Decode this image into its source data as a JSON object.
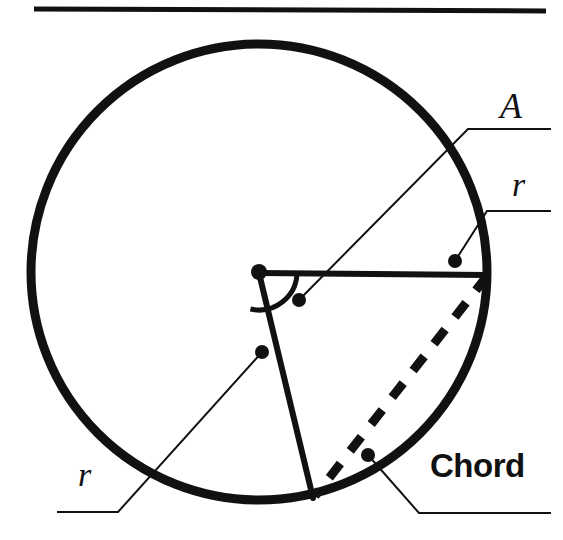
{
  "figure": {
    "background_color": "#ffffff",
    "ink_color": "#111111",
    "width": 563,
    "height": 540
  },
  "top_rule": {
    "name": "horizontal-rule",
    "x1": 34,
    "y1": 9,
    "x2": 546,
    "y2": 11,
    "thickness": 5
  },
  "circle": {
    "center_x": 259,
    "center_y": 272,
    "radius": 228,
    "stroke_width": 9,
    "color": "#111111"
  },
  "center_point": {
    "x": 259,
    "y": 272,
    "dot_radius": 8
  },
  "radii": [
    {
      "name": "radius-horizontal",
      "x1": 259,
      "y1": 273,
      "x2": 487,
      "y2": 275,
      "stroke_width": 6,
      "label": "r"
    },
    {
      "name": "radius-lower",
      "x1": 259,
      "y1": 273,
      "x2": 313,
      "y2": 498,
      "stroke_width": 6,
      "label": "r"
    }
  ],
  "chord": {
    "name": "chord-dashed",
    "x1": 487,
    "y1": 276,
    "x2": 315,
    "y2": 496,
    "stroke_width": 9,
    "dash": "18 16",
    "label": "Chord"
  },
  "angle_arc": {
    "name": "central-angle-arc",
    "center_x": 259,
    "center_y": 272,
    "radius": 38,
    "start_angle_deg": 0,
    "end_angle_deg": 103,
    "stroke_width": 5,
    "label": "A"
  },
  "labels": {
    "angle": {
      "text": "A",
      "style": "italic-serif",
      "leader": {
        "dot_x": 299,
        "dot_y": 300,
        "kink_x": 468,
        "kink_y": 129,
        "end_x": 551,
        "end_y": 129
      }
    },
    "radius_right": {
      "text": "r",
      "style": "italic-serif",
      "leader": {
        "dot_x": 455,
        "dot_y": 261,
        "kink_x": 487,
        "kink_y": 211,
        "end_x": 551,
        "end_y": 211
      }
    },
    "radius_left": {
      "text": "r",
      "style": "italic-serif",
      "leader": {
        "dot_x": 262,
        "dot_y": 352,
        "kink_x": 118,
        "kink_y": 512,
        "end_x": 57,
        "end_y": 512
      }
    },
    "chord": {
      "text": "Chord",
      "style": "bold-sans",
      "leader": {
        "dot_x": 368,
        "dot_y": 455,
        "kink_x": 419,
        "kink_y": 513,
        "end_x": 551,
        "end_y": 513
      }
    }
  },
  "leader_style": {
    "stroke_width": 2,
    "dot_radius": 7
  }
}
